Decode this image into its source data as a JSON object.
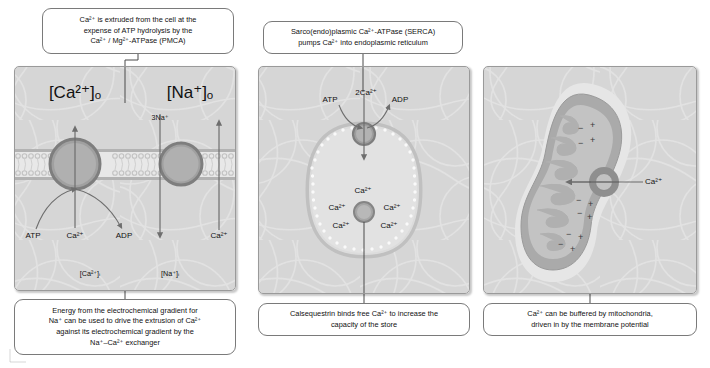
{
  "figure": {
    "background_color": "#ffffff",
    "panel_fill": "#d6d6d6",
    "panel_border": "#9a9a9a",
    "membrane_color": "#b9b9b9",
    "protein_fill": "#a8a8a8",
    "protein_stroke": "#7d7d7d",
    "text_color": "#111111"
  },
  "captions": {
    "pmca": {
      "lines": [
        "Ca²⁺ is extruded from the cell at the",
        "expense of ATP hydrolysis by the",
        "Ca²⁺ / Mg²⁺-ATPase (PMCA)"
      ]
    },
    "ncx": {
      "lines": [
        "Energy from the electrochemical gradient for",
        "Na⁺ can be used to drive the extrusion of Ca²⁺",
        "against its electrochemical gradient by the",
        "Na⁺–Ca²⁺ exchanger"
      ]
    },
    "serca": {
      "lines": [
        "Sarco(endo)plasmic Ca²⁺-ATPase (SERCA)",
        "pumps Ca²⁺ into endoplasmic reticulum"
      ]
    },
    "calsequestrin": {
      "lines": [
        "Calsequestrin binds free Ca²⁺ to increase the",
        "capacity of the store"
      ]
    },
    "mitochondria": {
      "lines": [
        "Ca²⁺ can be buffered by mitochondria,",
        "driven in by the membrane potential"
      ]
    }
  },
  "panel_left": {
    "name": "plasma-membrane-pumps",
    "labels": {
      "ca_out": "[Ca²⁺]ₒ",
      "na_out": "[Na⁺]ₒ",
      "ca_in": "[Ca²⁺]ᵢ",
      "na_in": "[Na⁺]ᵢ",
      "three_na": "3Na⁺",
      "atp": "ATP",
      "adp": "ADP",
      "ca_pump": "Ca²⁺",
      "ca_exchanger": "Ca²⁺"
    }
  },
  "panel_middle": {
    "name": "endoplasmic-reticulum-serca",
    "labels": {
      "atp": "ATP",
      "adp": "ADP",
      "two_ca": "2Ca²⁺",
      "store_ca": [
        "Ca²⁺",
        "Ca²⁺",
        "Ca²⁺",
        "Ca²⁺",
        "Ca²⁺"
      ]
    }
  },
  "panel_right": {
    "name": "mitochondrial-buffering",
    "labels": {
      "ca_uniporter": "Ca²⁺"
    },
    "charges_outer": [
      "+",
      "+",
      "+",
      "+",
      "+"
    ],
    "charges_inner": [
      "−",
      "−",
      "−",
      "−",
      "−"
    ]
  }
}
